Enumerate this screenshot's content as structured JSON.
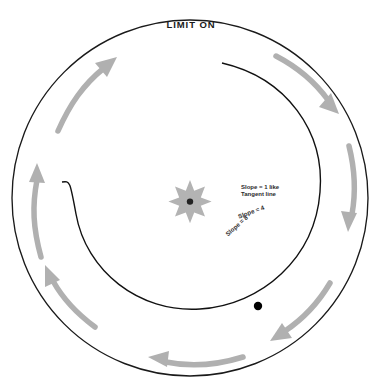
{
  "diagram": {
    "title": "LIMIT ON",
    "type": "annotated-circle-spiral",
    "colors": {
      "outline": "#1a1a1a",
      "spiral": "#111111",
      "arrow": "#b0b0b0",
      "star": "#b3b3b3",
      "star_center": "#222222",
      "point": "#000000",
      "background": "#ffffff",
      "text": "#2b2b2b"
    },
    "outer_circle": {
      "name": "outer-circle",
      "cx": 190,
      "cy": 198,
      "r": 178
    },
    "center_star": {
      "name": "center-starburst",
      "cx": 190,
      "cy": 196,
      "points": 8,
      "outer_r": 16,
      "inner_r": 6
    },
    "point_marker": {
      "name": "curve-point",
      "cx": 258,
      "cy": 306,
      "r": 4.2
    },
    "spiral_arc": {
      "name": "inner-spiral-arc",
      "start_x": 222,
      "start_y": 63,
      "end_x": 62,
      "end_y": 182
    },
    "labels": {
      "tangent_line_1": "Slope = 1 like",
      "tangent_line_2": "Tangent line",
      "slope_four": "Slope = 4",
      "slope_eight": "Slope = 8"
    },
    "arrows": [
      {
        "name": "arrow-top-left",
        "direction": "up-right"
      },
      {
        "name": "arrow-top-right",
        "direction": "down-right"
      },
      {
        "name": "arrow-right",
        "direction": "down"
      },
      {
        "name": "arrow-bottom-right",
        "direction": "down-left"
      },
      {
        "name": "arrow-bottom",
        "direction": "left"
      },
      {
        "name": "arrow-bottom-left",
        "direction": "up-left"
      },
      {
        "name": "arrow-left",
        "direction": "up"
      }
    ]
  }
}
